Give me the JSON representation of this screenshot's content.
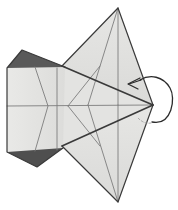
{
  "figure": {
    "title": "Origami fold step diagram",
    "description": "Kite shaped folded paper seen from the front with a curved fold-behind arrow at the right point",
    "canvas": {
      "width": 178,
      "height": 210,
      "background": "#ffffff"
    }
  },
  "palette": {
    "paper_front": "#e3e3e1",
    "paper_front_light": "#ebebe9",
    "paper_front_mid": "#dedede",
    "paper_back_dark": "#595959",
    "paper_back_dark_2": "#4f4f4f",
    "outline": "#3a3a3a",
    "crease": "#6e6e6e",
    "crease_light": "#8a8a8a",
    "arrow": "#2b2b2b",
    "background": "#ffffff"
  },
  "geometry": {
    "left_panel": {
      "name": "left-flap",
      "points": "7,68 22,50 62,66 62,146 37,167 7,152",
      "fill": "paper_front_light"
    },
    "left_panel_inner": {
      "name": "left-flap-inner",
      "points": "7,68 62,66 62,146 7,152",
      "fill": "paper_front_light"
    },
    "dark_triangle_top": {
      "name": "reverse-side-top",
      "points": "7,68 22,50 65,67",
      "fill": "paper_back_dark"
    },
    "dark_triangle_bottom": {
      "name": "reverse-side-bottom",
      "points": "7,152 37,167 63,148",
      "fill": "paper_back_dark_2"
    },
    "kite_upper": {
      "name": "upper-kite-panel",
      "points": "118,8 153,105 62,66",
      "fill": "paper_front_mid"
    },
    "kite_lower": {
      "name": "lower-kite-panel",
      "points": "118,202 153,105 62,146",
      "fill": "paper_front_mid"
    },
    "center_band": {
      "name": "center-band",
      "points": "62,66 153,105 62,146",
      "fill": "paper_front"
    },
    "creases": [
      {
        "name": "crease-horizontal-mid",
        "d": "M 7,106 L 153,105"
      },
      {
        "name": "crease-vertical-left",
        "d": "M 57,68 L 57,150"
      },
      {
        "name": "crease-zigzag-left",
        "d": "M 35,67 L 48,106 L 35,151"
      },
      {
        "name": "crease-vertical-apex-upper",
        "d": "M 118,8 L 118,105"
      },
      {
        "name": "crease-vertical-apex-lower",
        "d": "M 118,105 L 118,202"
      },
      {
        "name": "crease-upper-diagonal-a",
        "d": "M 118,8 L 88,105"
      },
      {
        "name": "crease-lower-diagonal-a",
        "d": "M 118,202 L 88,105"
      },
      {
        "name": "crease-center-upper",
        "d": "M 68,106 L 100,66"
      },
      {
        "name": "crease-center-lower",
        "d": "M 68,106 L 100,146"
      },
      {
        "name": "crease-hinge-upper",
        "d": "M 62,66 L 153,105"
      },
      {
        "name": "crease-hinge-lower",
        "d": "M 62,146 L 153,105"
      }
    ],
    "outlines": [
      {
        "name": "outline-kite-upper-left",
        "d": "M 62,66 L 118,8"
      },
      {
        "name": "outline-kite-upper-right",
        "d": "M 118,8 L 153,105"
      },
      {
        "name": "outline-kite-lower-right",
        "d": "M 153,105 L 118,202"
      },
      {
        "name": "outline-kite-lower-left",
        "d": "M 118,202 L 62,146"
      },
      {
        "name": "outline-left-top",
        "d": "M 7,68 L 22,50 L 65,67"
      },
      {
        "name": "outline-left-edge",
        "d": "M 7,68 L 7,152"
      },
      {
        "name": "outline-left-bottom",
        "d": "M 7,152 L 37,167 L 64,147"
      }
    ],
    "fold_edges": [
      {
        "name": "fold-edge-upper",
        "d": "M 62,66 L 153,105"
      },
      {
        "name": "fold-edge-lower",
        "d": "M 62,146 L 153,105"
      }
    ]
  },
  "annotations": {
    "fold_arrow": {
      "name": "fold-behind-arrow",
      "type": "curved-loop-arrow",
      "meaning": "fold the right point behind / around to the left",
      "loop_path": "M 152,122 C 172,126 176,98 170,88 C 163,76 150,74 140,80",
      "tail_path": "M 152,122 C 146,124 142,122 139,119",
      "head_path": "M 139,80 L 128,84 L 137,88",
      "head_tip": [
        128,
        84
      ],
      "stroke": "#2b2b2b",
      "stroke_width": 1.3
    }
  }
}
